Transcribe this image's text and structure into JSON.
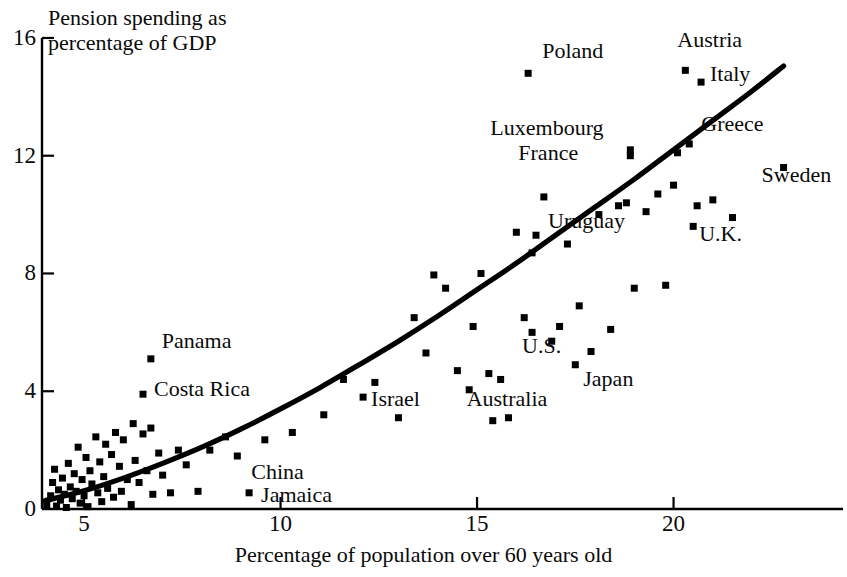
{
  "chart_data": {
    "type": "scatter",
    "title": "",
    "xlabel": "Percentage of population over 60 years old",
    "ylabel": "Pension spending as percentage of GDP",
    "xlim": [
      3.9,
      23.3
    ],
    "ylim": [
      0,
      16
    ],
    "xticks": [
      5,
      10,
      15,
      20
    ],
    "yticks": [
      0,
      4,
      8,
      12,
      16
    ],
    "xtick_labels": [
      "5",
      "10",
      "15",
      "20"
    ],
    "ytick_labels": [
      "0",
      "4",
      "8",
      "12",
      "16"
    ],
    "grid": false,
    "legend": null,
    "marker": "square",
    "marker_color": "#000000",
    "line_color": "#000000",
    "labeled_points": [
      {
        "name": "Poland",
        "x": 16.3,
        "y": 14.8,
        "label_dx": 14,
        "label_dy": -22
      },
      {
        "name": "Austria",
        "x": 20.3,
        "y": 14.9,
        "label_dx": -8,
        "label_dy": -30
      },
      {
        "name": "Italy",
        "x": 20.7,
        "y": 14.5,
        "label_dx": 9,
        "label_dy": -8
      },
      {
        "name": "Luxembourg",
        "x": 18.9,
        "y": 12.2,
        "label_dx": -140,
        "label_dy": -22
      },
      {
        "name": "Greece",
        "x": 20.4,
        "y": 12.4,
        "label_dx": 12,
        "label_dy": -20
      },
      {
        "name": "France",
        "x": 18.9,
        "y": 12.0,
        "label_dx": -112,
        "label_dy": -3
      },
      {
        "name": "Sweden",
        "x": 22.8,
        "y": 11.6,
        "label_dx": -22,
        "label_dy": 8
      },
      {
        "name": "Uruguay",
        "x": 16.5,
        "y": 9.3,
        "label_dx": 12,
        "label_dy": -14
      },
      {
        "name": "U.K.",
        "x": 20.5,
        "y": 9.6,
        "label_dx": 6,
        "label_dy": 8
      },
      {
        "name": "U.S.",
        "x": 16.4,
        "y": 6.0,
        "label_dx": -10,
        "label_dy": 14
      },
      {
        "name": "Japan",
        "x": 17.5,
        "y": 4.9,
        "label_dx": 8,
        "label_dy": 14
      },
      {
        "name": "Australia",
        "x": 15.6,
        "y": 4.4,
        "label_dx": -34,
        "label_dy": 20
      },
      {
        "name": "Israel",
        "x": 12.1,
        "y": 3.8,
        "label_dx": 8,
        "label_dy": 2
      },
      {
        "name": "Panama",
        "x": 6.7,
        "y": 5.1,
        "label_dx": 11,
        "label_dy": -18
      },
      {
        "name": "Costa Rica",
        "x": 6.5,
        "y": 3.9,
        "label_dx": 11,
        "label_dy": -5
      },
      {
        "name": "China",
        "x": 8.9,
        "y": 1.8,
        "label_dx": 14,
        "label_dy": 16
      },
      {
        "name": "Jamaica",
        "x": 9.2,
        "y": 0.55,
        "label_dx": 12,
        "label_dy": 2
      }
    ],
    "unlabeled_points": [
      {
        "x": 4.05,
        "y": 0.15
      },
      {
        "x": 4.15,
        "y": 0.45
      },
      {
        "x": 4.2,
        "y": 0.9
      },
      {
        "x": 4.25,
        "y": 1.35
      },
      {
        "x": 4.3,
        "y": 0.1
      },
      {
        "x": 4.35,
        "y": 0.65
      },
      {
        "x": 4.4,
        "y": 0.3
      },
      {
        "x": 4.45,
        "y": 1.05
      },
      {
        "x": 4.5,
        "y": 0.5
      },
      {
        "x": 4.55,
        "y": 0.05
      },
      {
        "x": 4.6,
        "y": 1.55
      },
      {
        "x": 4.65,
        "y": 0.75
      },
      {
        "x": 4.7,
        "y": 0.35
      },
      {
        "x": 4.75,
        "y": 1.2
      },
      {
        "x": 4.8,
        "y": 0.6
      },
      {
        "x": 4.85,
        "y": 2.1
      },
      {
        "x": 4.9,
        "y": 0.2
      },
      {
        "x": 4.95,
        "y": 1.0
      },
      {
        "x": 5.0,
        "y": 0.45
      },
      {
        "x": 5.05,
        "y": 1.75
      },
      {
        "x": 5.1,
        "y": 0.08
      },
      {
        "x": 5.15,
        "y": 1.3
      },
      {
        "x": 5.2,
        "y": 0.85
      },
      {
        "x": 5.3,
        "y": 2.45
      },
      {
        "x": 5.35,
        "y": 0.55
      },
      {
        "x": 5.4,
        "y": 1.6
      },
      {
        "x": 5.45,
        "y": 0.25
      },
      {
        "x": 5.5,
        "y": 1.1
      },
      {
        "x": 5.55,
        "y": 2.2
      },
      {
        "x": 5.6,
        "y": 0.7
      },
      {
        "x": 5.7,
        "y": 1.85
      },
      {
        "x": 5.75,
        "y": 0.4
      },
      {
        "x": 5.8,
        "y": 2.6
      },
      {
        "x": 5.9,
        "y": 1.45
      },
      {
        "x": 5.95,
        "y": 0.6
      },
      {
        "x": 6.0,
        "y": 2.35
      },
      {
        "x": 6.1,
        "y": 1.0
      },
      {
        "x": 6.2,
        "y": 0.15
      },
      {
        "x": 6.25,
        "y": 2.9
      },
      {
        "x": 6.3,
        "y": 1.65
      },
      {
        "x": 6.4,
        "y": 0.9
      },
      {
        "x": 6.5,
        "y": 2.55
      },
      {
        "x": 6.6,
        "y": 1.3
      },
      {
        "x": 6.7,
        "y": 2.75
      },
      {
        "x": 6.75,
        "y": 0.5
      },
      {
        "x": 6.9,
        "y": 1.9
      },
      {
        "x": 7.0,
        "y": 1.15
      },
      {
        "x": 7.2,
        "y": 0.55
      },
      {
        "x": 7.4,
        "y": 2.0
      },
      {
        "x": 7.6,
        "y": 1.5
      },
      {
        "x": 7.9,
        "y": 0.6
      },
      {
        "x": 8.2,
        "y": 2.0
      },
      {
        "x": 8.6,
        "y": 2.45
      },
      {
        "x": 9.6,
        "y": 2.35
      },
      {
        "x": 10.3,
        "y": 2.6
      },
      {
        "x": 11.1,
        "y": 3.2
      },
      {
        "x": 11.6,
        "y": 4.4
      },
      {
        "x": 12.4,
        "y": 4.3
      },
      {
        "x": 13.0,
        "y": 3.1
      },
      {
        "x": 13.4,
        "y": 6.5
      },
      {
        "x": 13.7,
        "y": 5.3
      },
      {
        "x": 13.9,
        "y": 7.95
      },
      {
        "x": 14.2,
        "y": 7.5
      },
      {
        "x": 14.5,
        "y": 4.7
      },
      {
        "x": 14.8,
        "y": 4.05
      },
      {
        "x": 14.9,
        "y": 6.2
      },
      {
        "x": 15.1,
        "y": 8.0
      },
      {
        "x": 15.3,
        "y": 4.6
      },
      {
        "x": 15.4,
        "y": 3.0
      },
      {
        "x": 15.8,
        "y": 3.1
      },
      {
        "x": 16.0,
        "y": 9.4
      },
      {
        "x": 16.2,
        "y": 6.5
      },
      {
        "x": 16.4,
        "y": 8.7
      },
      {
        "x": 16.7,
        "y": 10.6
      },
      {
        "x": 16.9,
        "y": 5.7
      },
      {
        "x": 17.1,
        "y": 6.2
      },
      {
        "x": 17.3,
        "y": 9.0
      },
      {
        "x": 17.6,
        "y": 6.9
      },
      {
        "x": 17.9,
        "y": 5.35
      },
      {
        "x": 18.1,
        "y": 10.0
      },
      {
        "x": 18.4,
        "y": 6.1
      },
      {
        "x": 18.6,
        "y": 10.3
      },
      {
        "x": 18.8,
        "y": 10.4
      },
      {
        "x": 19.0,
        "y": 7.5
      },
      {
        "x": 19.3,
        "y": 10.1
      },
      {
        "x": 19.6,
        "y": 10.7
      },
      {
        "x": 19.8,
        "y": 7.6
      },
      {
        "x": 20.0,
        "y": 11.0
      },
      {
        "x": 20.1,
        "y": 12.1
      },
      {
        "x": 20.6,
        "y": 10.3
      },
      {
        "x": 21.0,
        "y": 10.5
      },
      {
        "x": 21.5,
        "y": 9.9
      }
    ],
    "trend_line": {
      "description": "fitted increasing curve",
      "points": [
        {
          "x": 4.0,
          "y": 0.28
        },
        {
          "x": 5.0,
          "y": 0.62
        },
        {
          "x": 6.0,
          "y": 1.05
        },
        {
          "x": 7.0,
          "y": 1.55
        },
        {
          "x": 8.0,
          "y": 2.1
        },
        {
          "x": 9.0,
          "y": 2.72
        },
        {
          "x": 10.0,
          "y": 3.4
        },
        {
          "x": 11.0,
          "y": 4.12
        },
        {
          "x": 12.0,
          "y": 4.9
        },
        {
          "x": 13.0,
          "y": 5.7
        },
        {
          "x": 14.0,
          "y": 6.55
        },
        {
          "x": 15.0,
          "y": 7.45
        },
        {
          "x": 16.0,
          "y": 8.35
        },
        {
          "x": 17.0,
          "y": 9.3
        },
        {
          "x": 18.0,
          "y": 10.25
        },
        {
          "x": 19.0,
          "y": 11.2
        },
        {
          "x": 20.0,
          "y": 12.2
        },
        {
          "x": 21.0,
          "y": 13.2
        },
        {
          "x": 22.0,
          "y": 14.2
        },
        {
          "x": 22.8,
          "y": 15.05
        }
      ]
    }
  },
  "geometry": {
    "plot_left_px": 42,
    "plot_baseline_px": 509,
    "x_unit_px": 39.3,
    "x_origin_value": 3.93,
    "y_unit_px": 29.44
  }
}
